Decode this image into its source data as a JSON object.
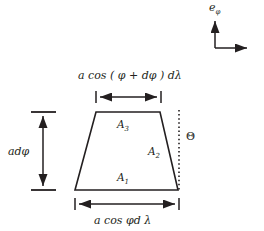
{
  "figure": {
    "background_color": "#ffffff",
    "line_color": "#231f20",
    "dotted_line_color": "#231f20"
  },
  "labels": {
    "top_dimension": "a cos ( φ + dφ ) dλ",
    "bottom_dimension": "a cos φd λ",
    "left_dimension": "adφ",
    "angle": "Θ",
    "unit_vector": "e",
    "unit_vector_sub": "φ",
    "area_1": "A",
    "area_1_sub": "1",
    "area_2": "A",
    "area_2_sub": "2",
    "area_3": "A",
    "area_3_sub": "3"
  },
  "geometry": {
    "trapezoid": {
      "top_left": [
        96,
        112
      ],
      "top_right": [
        160,
        112
      ],
      "bottom_right": [
        178,
        190
      ],
      "bottom_left": [
        75,
        190
      ]
    },
    "dotted_vertical_x": 179,
    "dotted_vertical_y_top": 110,
    "dotted_vertical_y_bottom": 192,
    "top_dimension_line": {
      "x1": 96,
      "x2": 161,
      "y": 97
    },
    "bottom_dimension_line": {
      "x1": 75,
      "x2": 179,
      "y": 204
    },
    "left_dimension_line": {
      "x": 43,
      "y1": 112,
      "y2": 190
    },
    "axes_origin": [
      215,
      48
    ],
    "axes_vertical_tip": [
      215,
      18
    ],
    "axes_horizontal_tip": [
      250,
      48
    ]
  }
}
